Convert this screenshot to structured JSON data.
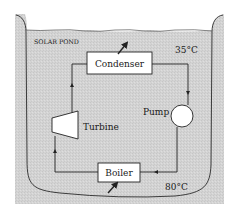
{
  "diagram": {
    "pond_label": "SOLAR POND",
    "top_temperature": "35°C",
    "bottom_temperature": "80°C",
    "components": {
      "condenser": "Condenser",
      "turbine": "Turbine",
      "pump": "Pump",
      "boiler": "Boiler"
    }
  },
  "colors": {
    "pond_fill": "#cfcfcf",
    "outer_fill": "#d9d9d9",
    "line": "#2a2a2a",
    "box_fill": "#ffffff"
  }
}
